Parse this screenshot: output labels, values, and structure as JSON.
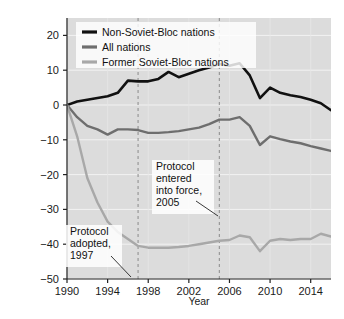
{
  "figure": {
    "caption": "FIGURE 18.24  The Kyoto Protocol produced mixed results."
  },
  "chart_data": {
    "type": "line",
    "title": "",
    "xlabel": "Year",
    "ylabel": "Percentage change from 1990 level",
    "xlim": [
      1990,
      2016
    ],
    "ylim": [
      -50,
      25
    ],
    "xticks": [
      1990,
      1994,
      1998,
      2002,
      2006,
      2010,
      2014
    ],
    "yticks": [
      20,
      10,
      0,
      -10,
      -20,
      -30,
      -40,
      -50
    ],
    "grid": true,
    "legend_position": "top-left",
    "x": [
      1990,
      1991,
      1992,
      1993,
      1994,
      1995,
      1996,
      1997,
      1998,
      1999,
      2000,
      2001,
      2002,
      2003,
      2004,
      2005,
      2006,
      2007,
      2008,
      2009,
      2010,
      2011,
      2012,
      2013,
      2014,
      2015,
      2016
    ],
    "series": [
      {
        "name": "Non-Soviet-Bloc nations",
        "color": "#111111",
        "values": [
          0,
          1,
          1.5,
          2,
          2.5,
          3.5,
          7,
          6.8,
          6.8,
          7.5,
          9.5,
          8,
          9,
          10,
          10.8,
          11.8,
          11.3,
          12,
          8.5,
          2,
          5,
          3.5,
          2.8,
          2.3,
          1.5,
          0.5,
          -1.5
        ]
      },
      {
        "name": "All nations",
        "color": "#6e6e6e",
        "values": [
          0,
          -3.5,
          -6,
          -7,
          -8.5,
          -7,
          -7,
          -7.2,
          -8,
          -8,
          -7.8,
          -7.5,
          -7,
          -6.5,
          -5.5,
          -4.2,
          -4.2,
          -3.5,
          -6,
          -11.5,
          -9,
          -9.8,
          -10.5,
          -11,
          -11.8,
          -12.5,
          -13.2
        ]
      },
      {
        "name": "Former Soviet-Bloc nations",
        "color": "#a8a8a8",
        "values": [
          0,
          -9,
          -21,
          -28,
          -33.5,
          -36.5,
          -38.5,
          -40.5,
          -41,
          -41,
          -41,
          -40.8,
          -40.5,
          -40,
          -39.5,
          -39,
          -38.8,
          -37.5,
          -38,
          -42,
          -39,
          -38.5,
          -38.8,
          -38.5,
          -38.5,
          -37,
          -37.8
        ]
      }
    ],
    "annotations": [
      {
        "id": "protocol-adopted",
        "lines": [
          "Protocol",
          "adopted,",
          "1997"
        ],
        "year": 1997
      },
      {
        "id": "protocol-entered-force",
        "lines": [
          "Protocol",
          "entered",
          "into force,",
          "2005"
        ],
        "year": 2005
      }
    ],
    "reference_lines": [
      {
        "id": "ref-1997",
        "year": 1997
      },
      {
        "id": "ref-2005",
        "year": 2005
      }
    ]
  }
}
